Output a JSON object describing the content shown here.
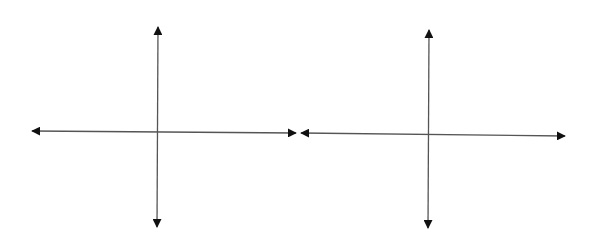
{
  "diagram": {
    "title": "",
    "stroke_color": "#555555",
    "arrow_color": "#111111",
    "axes": [
      {
        "name": "left-coordinate-axes",
        "x_axis": {
          "x1": 32,
          "y1": 131,
          "x2": 296,
          "y2": 133
        },
        "y_axis": {
          "x1": 158,
          "y1": 27,
          "x2": 157,
          "y2": 227
        }
      },
      {
        "name": "right-coordinate-axes",
        "x_axis": {
          "x1": 301,
          "y1": 133,
          "x2": 565,
          "y2": 136
        },
        "y_axis": {
          "x1": 429,
          "y1": 30,
          "x2": 428,
          "y2": 228
        }
      }
    ]
  }
}
